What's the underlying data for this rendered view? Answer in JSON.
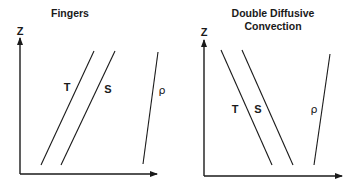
{
  "panels": [
    {
      "title_lines": [
        "Fingers"
      ],
      "y_axis_label": "Z",
      "curves": [
        {
          "label": "T",
          "description": "temperature profile, increasing with height"
        },
        {
          "label": "S",
          "description": "salinity profile, increasing with height"
        },
        {
          "label": "ρ",
          "description": "density profile"
        }
      ]
    },
    {
      "title_lines": [
        "Double Diffusive",
        "Convection"
      ],
      "y_axis_label": "Z",
      "curves": [
        {
          "label": "T",
          "description": "temperature profile, decreasing with height"
        },
        {
          "label": "S",
          "description": "salinity profile, decreasing with height"
        },
        {
          "label": "ρ",
          "description": "density profile"
        }
      ]
    }
  ]
}
